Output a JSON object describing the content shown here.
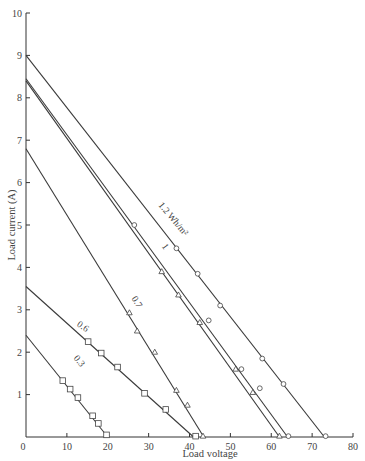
{
  "chart_data": {
    "type": "line",
    "title": "",
    "xlabel": "Load voltage",
    "ylabel": "Load current (A)",
    "xlim": [
      0,
      80
    ],
    "ylim": [
      0,
      10
    ],
    "x_ticks": [
      0,
      10,
      20,
      30,
      40,
      50,
      60,
      70,
      80
    ],
    "y_ticks": [
      1,
      2,
      3,
      4,
      5,
      6,
      7,
      8,
      9,
      10
    ],
    "grid": false,
    "legend": "inline labels along lines",
    "series": [
      {
        "name": "0.3",
        "label": "0.3",
        "marker": "square",
        "line": [
          [
            0,
            2.4
          ],
          [
            20,
            0
          ]
        ],
        "points": [
          [
            9,
            1.33
          ],
          [
            10.8,
            1.13
          ],
          [
            12.7,
            0.93
          ],
          [
            16.3,
            0.5
          ],
          [
            17.7,
            0.32
          ],
          [
            19.7,
            0.05
          ]
        ]
      },
      {
        "name": "0.6",
        "label": "0.6",
        "marker": "square",
        "line": [
          [
            0,
            3.55
          ],
          [
            41,
            0
          ]
        ],
        "points": [
          [
            15.2,
            2.25
          ],
          [
            18.4,
            1.98
          ],
          [
            22.4,
            1.65
          ],
          [
            29,
            1.03
          ],
          [
            34.2,
            0.65
          ],
          [
            41.5,
            0.02
          ]
        ]
      },
      {
        "name": "0.7",
        "label": "0.7",
        "marker": "triangle",
        "line": [
          [
            0,
            6.8
          ],
          [
            43.5,
            0
          ]
        ],
        "points": [
          [
            25.3,
            2.93
          ],
          [
            27.2,
            2.5
          ],
          [
            31.5,
            2.0
          ],
          [
            36.8,
            1.1
          ],
          [
            39.5,
            0.75
          ],
          [
            43.3,
            0.02
          ]
        ]
      },
      {
        "name": "1 (lower)",
        "label": "1",
        "marker": "triangle",
        "line": [
          [
            0,
            8.4
          ],
          [
            62,
            0
          ]
        ],
        "points": [
          [
            33.2,
            3.9
          ],
          [
            37.3,
            3.35
          ],
          [
            42.5,
            2.7
          ],
          [
            51.3,
            1.6
          ],
          [
            55.5,
            1.05
          ],
          [
            62,
            0.02
          ]
        ]
      },
      {
        "name": "1 (upper)",
        "label": "",
        "marker": "circle",
        "line": [
          [
            0,
            8.45
          ],
          [
            64,
            0
          ]
        ],
        "points": [
          [
            26.5,
            5.0
          ],
          [
            44.7,
            2.75
          ],
          [
            52.7,
            1.6
          ],
          [
            57.2,
            1.15
          ],
          [
            64.2,
            0.02
          ]
        ]
      },
      {
        "name": "1.2 Wh/m²",
        "label": "1.2 Wh/m²",
        "marker": "circle",
        "line": [
          [
            0,
            9.0
          ],
          [
            73,
            0
          ]
        ],
        "points": [
          [
            36.8,
            4.45
          ],
          [
            42,
            3.85
          ],
          [
            47.5,
            3.1
          ],
          [
            57.8,
            1.85
          ],
          [
            63,
            1.25
          ],
          [
            73.3,
            0.02
          ]
        ]
      }
    ]
  }
}
